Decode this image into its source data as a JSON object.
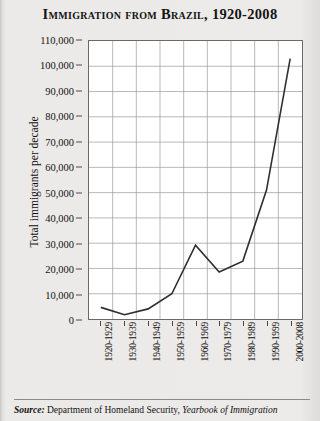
{
  "chart_data": {
    "type": "line",
    "title": "Immigration from Brazil, 1920-2008",
    "xlabel": "",
    "ylabel": "Total immigrants per decade",
    "categories": [
      "1920-1929",
      "1930-1939",
      "1940-1949",
      "1950-1959",
      "1960-1969",
      "1970-1979",
      "1980-1989",
      "1990-1999",
      "2000-2008"
    ],
    "values": [
      4600,
      1700,
      4000,
      10000,
      29200,
      18600,
      22900,
      51000,
      103000
    ],
    "series": [
      {
        "name": "Total immigrants per decade",
        "values": [
          4600,
          1700,
          4000,
          10000,
          29200,
          18600,
          22900,
          51000,
          103000
        ]
      }
    ],
    "ylim": [
      0,
      110000
    ],
    "yticks": [
      0,
      10000,
      20000,
      30000,
      40000,
      50000,
      60000,
      70000,
      80000,
      90000,
      100000,
      110000
    ],
    "ytick_labels": [
      "0",
      "10,000",
      "20,000",
      "30,000",
      "40,000",
      "50,000",
      "60,000",
      "70,000",
      "80,000",
      "90,000",
      "100,000",
      "110,000"
    ],
    "grid": true,
    "legend": "none",
    "line_color": "#2e2e2e",
    "grid_color": "#9a9a9a",
    "plot_bg": "#ffffff"
  },
  "source": {
    "label": "Source:",
    "agency": "Department of Homeland Security,",
    "publication": "Yearbook of Immigration"
  }
}
